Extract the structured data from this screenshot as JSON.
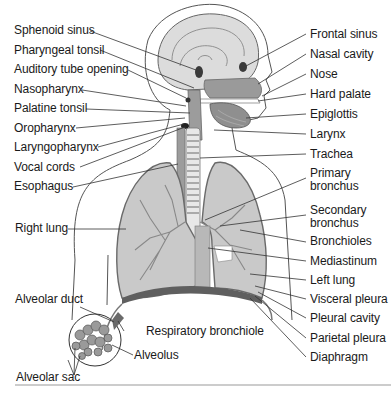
{
  "figure": {
    "type": "anatomical-diagram",
    "colors": {
      "background": "#ffffff",
      "outline": "#555555",
      "tissue_light": "#d9d9d9",
      "tissue_mid": "#a8a8a8",
      "tissue_dark": "#5a5a5a",
      "label_text": "#1a1a1a",
      "leader_line": "#333333"
    }
  },
  "labels_left": [
    {
      "text": "Sphenoid sinus"
    },
    {
      "text": "Pharyngeal tonsil"
    },
    {
      "text": "Auditory tube opening"
    },
    {
      "text": "Nasopharynx"
    },
    {
      "text": "Palatine tonsil"
    },
    {
      "text": "Oropharynx"
    },
    {
      "text": "Laryngopharynx"
    },
    {
      "text": "Vocal cords"
    },
    {
      "text": "Esophagus"
    },
    {
      "text": "Right lung"
    },
    {
      "text": "Alveolar duct"
    },
    {
      "text": "Alveolar sac"
    }
  ],
  "labels_right": [
    {
      "text": "Frontal sinus"
    },
    {
      "text": "Nasal cavity"
    },
    {
      "text": "Nose"
    },
    {
      "text": "Hard palate"
    },
    {
      "text": "Epiglottis"
    },
    {
      "text": "Larynx"
    },
    {
      "text": "Trachea"
    },
    {
      "text": "Primary\nbronchus"
    },
    {
      "text": "Secondary\nbronchus"
    },
    {
      "text": "Bronchioles"
    },
    {
      "text": "Mediastinum"
    },
    {
      "text": "Left lung"
    },
    {
      "text": "Visceral pleura"
    },
    {
      "text": "Pleural cavity"
    },
    {
      "text": "Parietal pleura"
    },
    {
      "text": "Diaphragm"
    }
  ],
  "labels_inset": [
    {
      "text": "Respiratory bronchiole"
    },
    {
      "text": "Alveolus"
    }
  ]
}
